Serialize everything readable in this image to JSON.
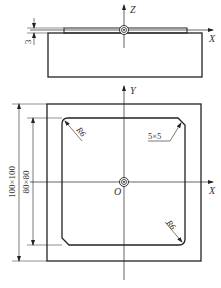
{
  "drawing": {
    "front_view": {
      "axes": {
        "z_label": "Z",
        "x_label": "X"
      },
      "dimension_thickness": "3"
    },
    "top_view": {
      "axes": {
        "y_label": "Y",
        "x_label": "X",
        "origin_label": "O"
      },
      "dimension_outer": "100×100",
      "dimension_inner": "80×80",
      "radius_top_left": "R6",
      "radius_bottom_right": "R6",
      "chamfer": "5×5"
    }
  }
}
